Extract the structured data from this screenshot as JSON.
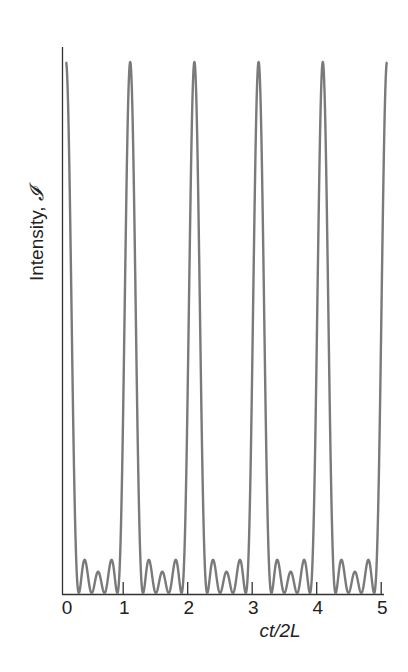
{
  "chart_data": {
    "type": "line",
    "title": "",
    "xlabel": "ct/2L",
    "ylabel": "Intensity, 𝓘",
    "ylabel_text": "Intensity, ",
    "ylabel_symbol": "𝓘",
    "xlim": [
      0,
      5
    ],
    "ylim": [
      0,
      1
    ],
    "x_ticks": [
      0,
      1,
      2,
      3,
      4,
      5
    ],
    "x_tick_labels": [
      "0",
      "1",
      "2",
      "3",
      "4",
      "5"
    ],
    "y_ticks": [],
    "grid": false,
    "legend": null,
    "num_modes": 5,
    "period": 1.0,
    "peak_offset": 0.06,
    "series": [
      {
        "name": "Intensity",
        "color": "#7a7a7a",
        "main_peaks": {
          "x": [
            0,
            1,
            2,
            3,
            4,
            5
          ],
          "y": [
            1,
            1,
            1,
            1,
            1,
            1
          ]
        },
        "secondary_peaks_per_period": {
          "x_offset": [
            0.3,
            0.5,
            0.7
          ],
          "y": [
            0.065,
            0.04,
            0.065
          ]
        },
        "zeros_per_period": [
          0.2,
          0.4,
          0.6,
          0.8
        ]
      }
    ]
  },
  "style": {
    "axis_color": "#333333",
    "curve_color": "#7a7a7a"
  }
}
